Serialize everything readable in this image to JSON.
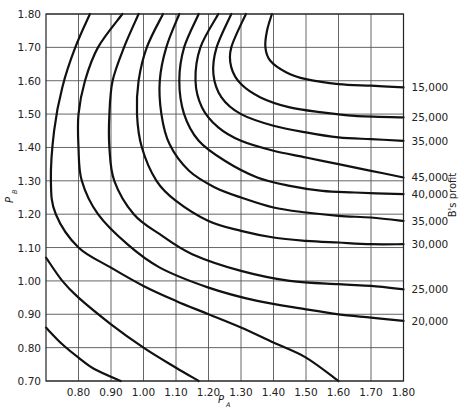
{
  "chart_data": {
    "type": "contour",
    "title": "",
    "xlabel": "P",
    "xlabel_sub": "A",
    "ylabel": "P",
    "ylabel_sub": "B",
    "right_label": "B's profit",
    "xlim": [
      0.7,
      1.8
    ],
    "ylim": [
      0.7,
      1.8
    ],
    "grid": true,
    "x_ticks": [
      "0.80",
      "0.90",
      "1.00",
      "1.10",
      "1.20",
      "1.30",
      "1.40",
      "1.50",
      "1.60",
      "1.70",
      "1.80"
    ],
    "x_tick_values": [
      0.8,
      0.9,
      1.0,
      1.1,
      1.2,
      1.3,
      1.4,
      1.5,
      1.6,
      1.7,
      1.8
    ],
    "y_ticks": [
      "0.70",
      "0.80",
      "0.90",
      "1.00",
      "1.10",
      "1.20",
      "1.30",
      "1.40",
      "1.50",
      "1.60",
      "1.70",
      "1.80"
    ],
    "y_tick_values": [
      0.7,
      0.8,
      0.9,
      1.0,
      1.1,
      1.2,
      1.3,
      1.4,
      1.5,
      1.6,
      1.7,
      1.8
    ],
    "contours": [
      {
        "label": "",
        "points": [
          [
            0.7,
            0.86
          ],
          [
            0.75,
            0.81
          ],
          [
            0.8,
            0.77
          ],
          [
            0.85,
            0.735
          ],
          [
            0.93,
            0.7
          ]
        ]
      },
      {
        "label": "",
        "points": [
          [
            0.7,
            1.07
          ],
          [
            0.75,
            1.0
          ],
          [
            0.8,
            0.95
          ],
          [
            0.9,
            0.87
          ],
          [
            1.0,
            0.8
          ],
          [
            1.1,
            0.74
          ],
          [
            1.17,
            0.7
          ]
        ]
      },
      {
        "label": "",
        "points": [
          [
            0.835,
            1.8
          ],
          [
            0.79,
            1.7
          ],
          [
            0.75,
            1.58
          ],
          [
            0.725,
            1.45
          ],
          [
            0.715,
            1.3
          ],
          [
            0.73,
            1.2
          ],
          [
            0.8,
            1.1
          ],
          [
            0.9,
            1.04
          ],
          [
            1.0,
            0.985
          ],
          [
            1.1,
            0.94
          ],
          [
            1.2,
            0.9
          ],
          [
            1.3,
            0.86
          ],
          [
            1.4,
            0.815
          ],
          [
            1.5,
            0.77
          ],
          [
            1.6,
            0.7
          ]
        ]
      },
      {
        "label": "20,000",
        "points": [
          [
            0.935,
            1.8
          ],
          [
            0.86,
            1.7
          ],
          [
            0.82,
            1.6
          ],
          [
            0.8,
            1.5
          ],
          [
            0.8,
            1.4
          ],
          [
            0.81,
            1.3
          ],
          [
            0.86,
            1.2
          ],
          [
            0.95,
            1.11
          ],
          [
            1.05,
            1.04
          ],
          [
            1.2,
            0.98
          ],
          [
            1.35,
            0.94
          ],
          [
            1.5,
            0.915
          ],
          [
            1.6,
            0.9
          ],
          [
            1.7,
            0.89
          ],
          [
            1.8,
            0.88
          ]
        ]
      },
      {
        "label": "25,000",
        "points": [
          [
            0.985,
            1.8
          ],
          [
            0.94,
            1.7
          ],
          [
            0.905,
            1.6
          ],
          [
            0.895,
            1.5
          ],
          [
            0.895,
            1.4
          ],
          [
            0.91,
            1.3
          ],
          [
            0.97,
            1.2
          ],
          [
            1.05,
            1.14
          ],
          [
            1.15,
            1.08
          ],
          [
            1.3,
            1.03
          ],
          [
            1.45,
            1.0
          ],
          [
            1.6,
            0.99
          ],
          [
            1.7,
            0.985
          ],
          [
            1.8,
            0.975
          ]
        ]
      },
      {
        "label": "30,000",
        "points": [
          [
            1.06,
            1.8
          ],
          [
            1.01,
            1.7
          ],
          [
            0.985,
            1.6
          ],
          [
            0.98,
            1.5
          ],
          [
            0.995,
            1.4
          ],
          [
            1.04,
            1.3
          ],
          [
            1.1,
            1.24
          ],
          [
            1.2,
            1.18
          ],
          [
            1.3,
            1.15
          ],
          [
            1.4,
            1.13
          ],
          [
            1.5,
            1.12
          ],
          [
            1.6,
            1.115
          ],
          [
            1.7,
            1.11
          ],
          [
            1.8,
            1.11
          ]
        ]
      },
      {
        "label": "35,000",
        "points": [
          [
            1.11,
            1.8
          ],
          [
            1.07,
            1.7
          ],
          [
            1.05,
            1.6
          ],
          [
            1.055,
            1.5
          ],
          [
            1.08,
            1.41
          ],
          [
            1.14,
            1.33
          ],
          [
            1.22,
            1.28
          ],
          [
            1.3,
            1.25
          ],
          [
            1.4,
            1.22
          ],
          [
            1.5,
            1.205
          ],
          [
            1.6,
            1.195
          ],
          [
            1.7,
            1.19
          ],
          [
            1.8,
            1.18
          ]
        ]
      },
      {
        "label": "40,000",
        "points": [
          [
            1.17,
            1.8
          ],
          [
            1.125,
            1.7
          ],
          [
            1.11,
            1.6
          ],
          [
            1.125,
            1.5
          ],
          [
            1.17,
            1.42
          ],
          [
            1.25,
            1.36
          ],
          [
            1.35,
            1.31
          ],
          [
            1.45,
            1.285
          ],
          [
            1.55,
            1.27
          ],
          [
            1.65,
            1.265
          ],
          [
            1.8,
            1.26
          ]
        ]
      },
      {
        "label": "45,000",
        "points": [
          [
            1.23,
            1.8
          ],
          [
            1.175,
            1.7
          ],
          [
            1.16,
            1.6
          ],
          [
            1.18,
            1.52
          ],
          [
            1.23,
            1.46
          ],
          [
            1.3,
            1.42
          ],
          [
            1.4,
            1.39
          ],
          [
            1.5,
            1.37
          ],
          [
            1.6,
            1.35
          ],
          [
            1.7,
            1.33
          ],
          [
            1.8,
            1.31
          ]
        ]
      },
      {
        "label": "35,000",
        "points": [
          [
            1.27,
            1.8
          ],
          [
            1.225,
            1.7
          ],
          [
            1.215,
            1.62
          ],
          [
            1.24,
            1.55
          ],
          [
            1.3,
            1.5
          ],
          [
            1.4,
            1.465
          ],
          [
            1.5,
            1.445
          ],
          [
            1.6,
            1.43
          ],
          [
            1.7,
            1.425
          ],
          [
            1.8,
            1.42
          ]
        ]
      },
      {
        "label": "25,000",
        "points": [
          [
            1.315,
            1.8
          ],
          [
            1.27,
            1.7
          ],
          [
            1.27,
            1.64
          ],
          [
            1.3,
            1.59
          ],
          [
            1.36,
            1.55
          ],
          [
            1.45,
            1.52
          ],
          [
            1.55,
            1.505
          ],
          [
            1.65,
            1.495
          ],
          [
            1.8,
            1.49
          ]
        ]
      },
      {
        "label": "15,000",
        "points": [
          [
            1.395,
            1.8
          ],
          [
            1.38,
            1.75
          ],
          [
            1.375,
            1.7
          ],
          [
            1.39,
            1.66
          ],
          [
            1.44,
            1.625
          ],
          [
            1.5,
            1.605
          ],
          [
            1.6,
            1.59
          ],
          [
            1.7,
            1.585
          ],
          [
            1.8,
            1.58
          ]
        ]
      }
    ]
  }
}
